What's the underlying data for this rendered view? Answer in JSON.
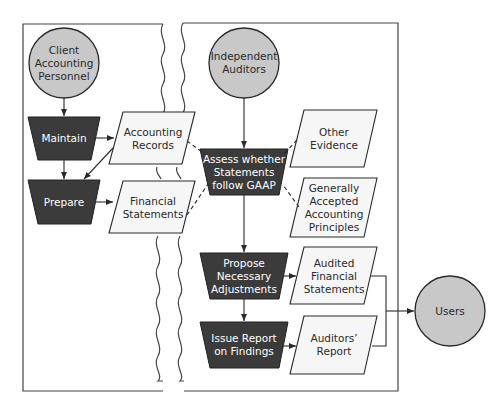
{
  "diagram": {
    "colors": {
      "process_fill": "#3b3b3b",
      "entity_fill": "#c8c8c8",
      "document_fill": "#f6f6f6",
      "stroke": "#2a2a2a"
    },
    "entities": {
      "client": "Client\nAccounting\nPersonnel",
      "auditors": "Independent\nAuditors",
      "users": "Users"
    },
    "processes": {
      "maintain": "Maintain",
      "prepare": "Prepare",
      "assess": "Assess whether\nStatements\nfollow GAAP",
      "propose": "Propose\nNecessary\nAdjustments",
      "issue": "Issue Report\non Findings"
    },
    "documents": {
      "accounting_records": "Accounting\nRecords",
      "financial_statements": "Financial\nStatements",
      "other_evidence": "Other\nEvidence",
      "gaap": "Generally\nAccepted\nAccounting\nPrinciples",
      "audited_fs": "Audited\nFinancial\nStatements",
      "auditors_report": "Auditors’\nReport"
    }
  }
}
